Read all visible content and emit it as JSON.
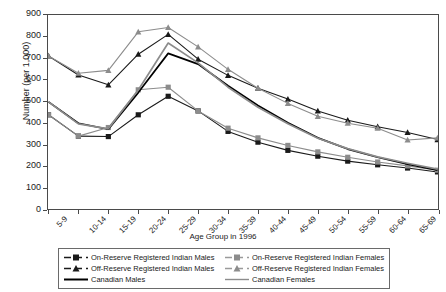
{
  "chart_data": {
    "type": "line",
    "title": "",
    "xlabel": "Age Group in 1996",
    "ylabel": "Number (per 1,000)",
    "ylim": [
      0,
      900
    ],
    "ytick_step": 100,
    "yticks": [
      0,
      100,
      200,
      300,
      400,
      500,
      600,
      700,
      800,
      900
    ],
    "grid": false,
    "legend_position": "bottom",
    "categories": [
      "5-9",
      "10-14",
      "15-19",
      "20-24",
      "25-29",
      "30-34",
      "35-39",
      "40-44",
      "45-49",
      "50-54",
      "55-59",
      "60-64",
      "65-69",
      "70-74"
    ],
    "series": [
      {
        "name": "On-Reserve Registered Indian Males",
        "marker": "square",
        "color": "#1a1a1a",
        "line_style": "solid",
        "values": [
          437,
          338,
          336,
          437,
          523,
          455,
          360,
          310,
          272,
          245,
          222,
          205,
          190,
          172
        ]
      },
      {
        "name": "On-Reserve Registered Indian Females",
        "marker": "square",
        "color": "#8c8c8c",
        "line_style": "solid",
        "values": [
          437,
          338,
          378,
          553,
          565,
          455,
          375,
          330,
          295,
          265,
          240,
          218,
          200,
          180
        ]
      },
      {
        "name": "Off-Reserve Registered Indian Males",
        "marker": "triangle",
        "color": "#1a1a1a",
        "line_style": "solid",
        "values": [
          710,
          622,
          576,
          718,
          810,
          695,
          620,
          560,
          510,
          455,
          412,
          382,
          355,
          322
        ]
      },
      {
        "name": "Off-Reserve Registered Indian Females",
        "marker": "triangle",
        "color": "#8c8c8c",
        "line_style": "solid",
        "values": [
          710,
          630,
          643,
          822,
          842,
          752,
          648,
          560,
          490,
          430,
          398,
          375,
          320,
          330
        ]
      },
      {
        "name": "Canadian Males",
        "marker": "none",
        "color": "#000000",
        "line_style": "solid",
        "values": [
          497,
          398,
          370,
          540,
          722,
          672,
          572,
          480,
          400,
          330,
          278,
          240,
          208,
          180
        ]
      },
      {
        "name": "Canadian Females",
        "marker": "none",
        "color": "#8c8c8c",
        "line_style": "solid",
        "values": [
          497,
          395,
          372,
          552,
          770,
          678,
          565,
          472,
          395,
          328,
          280,
          242,
          212,
          185
        ]
      }
    ]
  },
  "legend": {
    "entries": [
      {
        "label": "On-Reserve Registered Indian Males"
      },
      {
        "label": "On-Reserve Registered Indian Females"
      },
      {
        "label": "Off-Reserve Registered Indian Males"
      },
      {
        "label": "Off-Reserve Registered Indian Females"
      },
      {
        "label": "Canadian Males"
      },
      {
        "label": "Canadian Females"
      }
    ]
  }
}
